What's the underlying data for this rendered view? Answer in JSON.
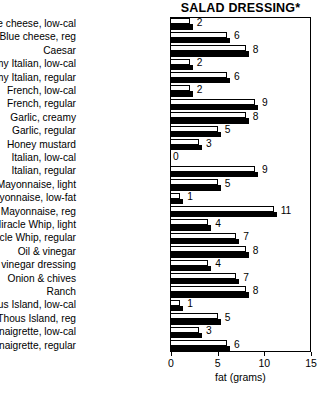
{
  "chart_data": {
    "type": "bar",
    "orientation": "horizontal",
    "title": "SALAD DRESSING*",
    "xlabel": "fat (grams)",
    "ylabel": "",
    "xlim": [
      0,
      15
    ],
    "xticks": [
      0,
      5,
      10,
      15
    ],
    "xtick_labels": [
      "0",
      "5",
      "10",
      "15"
    ],
    "grid": false,
    "legend": null,
    "categories": [
      "Blue cheese, low-cal",
      "Blue cheese, reg",
      "Caesar",
      "Creamy Italian, low-cal",
      "Creamy Italian, regular",
      "French, low-cal",
      "French, regular",
      "Garlic, creamy",
      "Garlic, regular",
      "Honey mustard",
      "Italian, low-cal",
      "Italian, regular",
      "Mayonnaise, light",
      "Mayonnaise, low-fat",
      "Mayonnaise, reg",
      "Miracle Whip, light",
      "Miracle Whip, regular",
      "Oil & vinegar",
      "Oil & vinegar dressing",
      "Onion & chives",
      "Ranch",
      "Russian/Thous Island, low-cal",
      "Russian/Thous Island, reg",
      "Vinaigrette, low-cal",
      "Vinaigrette, regular"
    ],
    "values": [
      2,
      6,
      8,
      2,
      6,
      2,
      9,
      8,
      5,
      3,
      0,
      9,
      5,
      1,
      11,
      4,
      7,
      8,
      4,
      7,
      8,
      1,
      5,
      3,
      6
    ],
    "value_labels": [
      "2",
      "6",
      "8",
      "2",
      "6",
      "2",
      "9",
      "8",
      "5",
      "3",
      "0",
      "9",
      "5",
      "1",
      "11",
      "4",
      "7",
      "8",
      "4",
      "7",
      "8",
      "1",
      "5",
      "3",
      "6"
    ]
  },
  "colors": {
    "bar_face": "#ffffff",
    "bar_edge": "#000000",
    "bar_shadow": "#000000",
    "background": "#ffffff",
    "text": "#000000"
  }
}
